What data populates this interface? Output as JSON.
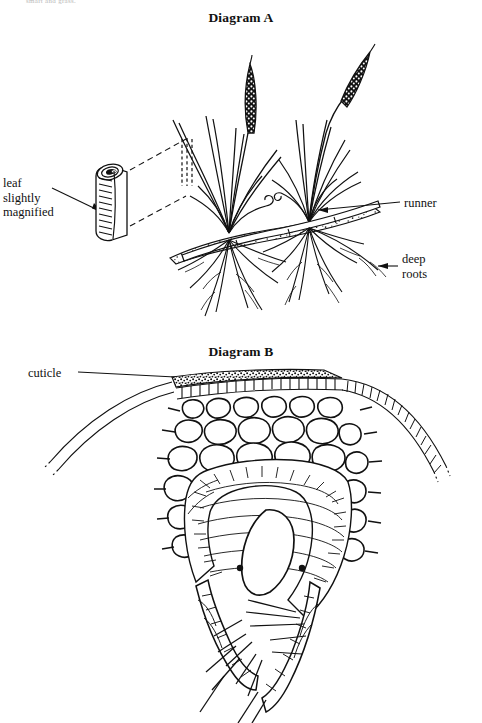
{
  "page": {
    "header_remnant": "smart and grass.",
    "background_color": "#ffffff",
    "ink_color": "#111111",
    "width": 482,
    "height": 723
  },
  "figures": [
    {
      "id": "diagram-a",
      "title": "Diagram A",
      "subject": "grass plant with runner and deep roots, plus magnified rolled leaf",
      "labels": [
        {
          "name": "leaf-slightly-magnified",
          "text": "leaf\nslightly\nmagnified",
          "connector": "arrow"
        },
        {
          "name": "runner",
          "text": "runner",
          "connector": "leader-line"
        },
        {
          "name": "deep-roots",
          "text": "deep\nroots",
          "connector": "arrow"
        }
      ]
    },
    {
      "id": "diagram-b",
      "title": "Diagram B",
      "subject": "cross-section of rolled leaf showing cuticle, epidermis, parenchyma cells and hairs",
      "labels": [
        {
          "name": "cuticle",
          "text": "cuticle",
          "connector": "leader-line"
        }
      ]
    }
  ],
  "titles": {
    "diagram_a": "Diagram A",
    "diagram_b": "Diagram B"
  },
  "callouts": {
    "leaf_slightly_magnified": "leaf\nslightly\nmagnified",
    "runner": "runner",
    "deep_roots": "deep\nroots",
    "cuticle": "cuticle"
  }
}
